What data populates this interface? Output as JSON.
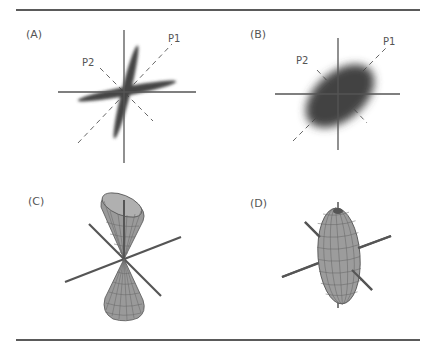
{
  "figure": {
    "panels": [
      {
        "id": "A",
        "label": "(A)",
        "description": "two elongated Gaussian blobs forming a cross, with dashed principal axes",
        "axis_labels": {
          "p1": "P1",
          "p2": "P2"
        }
      },
      {
        "id": "B",
        "label": "(B)",
        "description": "single tilted elliptical Gaussian blob, with dashed principal axes",
        "axis_labels": {
          "p1": "P1",
          "p2": "P2"
        }
      },
      {
        "id": "C",
        "label": "(C)",
        "description": "3D double cone (hyperboloid-like) wireframe surface with three axes"
      },
      {
        "id": "D",
        "label": "(D)",
        "description": "3D prolate ellipsoid wireframe surface with three axes"
      }
    ],
    "colors": {
      "axis": "#555555",
      "blob": "#444444",
      "surface_fill": "#9a9a9a",
      "mesh": "#555555",
      "rule": "#5a5a5a",
      "text": "#555555"
    }
  }
}
